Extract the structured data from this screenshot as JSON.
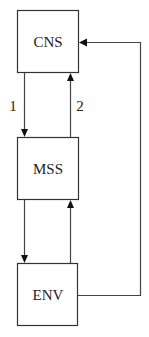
{
  "diagram": {
    "nodes": [
      {
        "id": "cns",
        "label": "CNS"
      },
      {
        "id": "mss",
        "label": "MSS"
      },
      {
        "id": "env",
        "label": "ENV"
      }
    ],
    "edges": [
      {
        "from": "cns",
        "to": "mss",
        "label": "1"
      },
      {
        "from": "mss",
        "to": "cns",
        "label": "2"
      },
      {
        "from": "mss",
        "to": "env",
        "label": ""
      },
      {
        "from": "env",
        "to": "mss",
        "label": ""
      },
      {
        "from": "env",
        "to": "cns",
        "label": ""
      }
    ],
    "colors": {
      "stroke": "#333333",
      "background": "#ffffff"
    }
  }
}
